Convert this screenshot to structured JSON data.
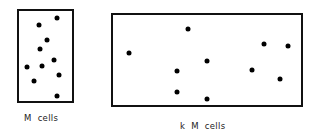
{
  "diagram": {
    "left_panel": {
      "label": "M  cells",
      "box": {
        "x": 17,
        "y": 9,
        "w": 57,
        "h": 94
      },
      "dots": [
        [
          57,
          18
        ],
        [
          39,
          25
        ],
        [
          47,
          40
        ],
        [
          40,
          49
        ],
        [
          54,
          60
        ],
        [
          27,
          67
        ],
        [
          42,
          66
        ],
        [
          59,
          75
        ],
        [
          34,
          81
        ],
        [
          57,
          96
        ]
      ]
    },
    "right_panel": {
      "label": "k  M  cells",
      "box": {
        "x": 111,
        "y": 13,
        "w": 192,
        "h": 94
      },
      "dots": [
        [
          188,
          29
        ],
        [
          129,
          53
        ],
        [
          264,
          44
        ],
        [
          288,
          46
        ],
        [
          207,
          61
        ],
        [
          177,
          71
        ],
        [
          252,
          70
        ],
        [
          280,
          79
        ],
        [
          177,
          92
        ],
        [
          207,
          99
        ]
      ]
    },
    "colors": {
      "stroke": "#111111",
      "dot": "#000000",
      "background": "#ffffff"
    }
  }
}
